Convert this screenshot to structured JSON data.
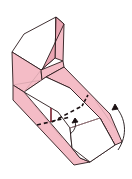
{
  "diagram": {
    "type": "origami-folding-step",
    "colors": {
      "background": "#ffffff",
      "paper_colored": "#f4bcc6",
      "paper_colored_dark": "#eaa5b2",
      "paper_white": "#ffffff",
      "outline": "#2a1a1c",
      "crease": "#c99aa3"
    },
    "symbols": [
      {
        "name": "valley-fold-line",
        "style": "dashed"
      },
      {
        "name": "fold-arrow",
        "direction": "up-right",
        "meaning": "rotate flap up"
      },
      {
        "name": "small-fold-arrow",
        "direction": "up",
        "meaning": "lift edge"
      }
    ]
  }
}
